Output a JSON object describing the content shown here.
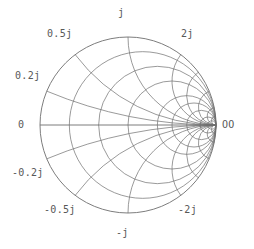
{
  "figure": {
    "kind": "smith-chart",
    "background_color": "#ffffff",
    "line_color": "#6e6e6e",
    "text_color": "#585858"
  },
  "labels": {
    "top": "j",
    "upper_left": "0.5j",
    "upper_right": "2j",
    "left_upper": "0.2j",
    "origin": "0",
    "right": "OO",
    "left_lower": "-0.2j",
    "lower_left": "-0.5j",
    "lower_right": "-2j",
    "bottom": "-j"
  },
  "chart_data": {
    "type": "line",
    "subtitle": "",
    "xlabel": "",
    "ylabel": "",
    "grid": true,
    "legend_position": "none",
    "xlim": [
      -1,
      1
    ],
    "ylim": [
      -1,
      1
    ],
    "geometry": {
      "center_x": 128,
      "center_y": 125,
      "radius": 88,
      "open_point_x": 216,
      "open_point_y": 125
    },
    "resistance_circles": {
      "description": "constant-resistance circles, center (r/(1+r),0) radius 1/(1+r) in unit-circle coords",
      "values": [
        0,
        0.2,
        0.5,
        1,
        2,
        3,
        5,
        10,
        20
      ]
    },
    "reactance_arcs": {
      "description": "constant-reactance arcs, center (1,1/x) radius 1/|x| in unit-circle coords",
      "values": [
        0.2,
        0.5,
        1,
        2,
        3,
        5,
        10,
        20,
        -0.2,
        -0.5,
        -1,
        -2,
        -3,
        -5,
        -10,
        -20
      ]
    },
    "real_axis": {
      "description": "horizontal x=0 reactance line across the chart diameter",
      "from": [
        -1,
        0
      ],
      "to": [
        1,
        0
      ]
    },
    "tick_labels": [
      {
        "text": "j",
        "value": 1,
        "kind": "reactance",
        "position": "top"
      },
      {
        "text": "0.5j",
        "value": 0.5,
        "kind": "reactance",
        "position": "upper-left"
      },
      {
        "text": "2j",
        "value": 2,
        "kind": "reactance",
        "position": "upper-right"
      },
      {
        "text": "0.2j",
        "value": 0.2,
        "kind": "reactance",
        "position": "left-upper"
      },
      {
        "text": "0",
        "value": 0,
        "kind": "resistance",
        "position": "left"
      },
      {
        "text": "OO",
        "value": null,
        "kind": "resistance",
        "position": "right"
      },
      {
        "text": "-0.2j",
        "value": -0.2,
        "kind": "reactance",
        "position": "left-lower"
      },
      {
        "text": "-0.5j",
        "value": -0.5,
        "kind": "reactance",
        "position": "lower-left"
      },
      {
        "text": "-2j",
        "value": -2,
        "kind": "reactance",
        "position": "lower-right"
      },
      {
        "text": "-j",
        "value": -1,
        "kind": "reactance",
        "position": "bottom"
      }
    ]
  }
}
